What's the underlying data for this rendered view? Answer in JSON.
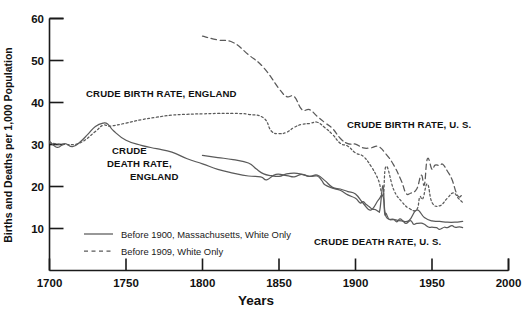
{
  "chart_data": {
    "type": "line",
    "title": "",
    "xlabel": "Years",
    "ylabel": "Births and Deaths per 1,000 Population",
    "xlim": [
      1700,
      2000
    ],
    "ylim": [
      0,
      60
    ],
    "xticks": [
      1700,
      1750,
      1800,
      1850,
      1900,
      1950,
      2000
    ],
    "yticks": [
      10,
      20,
      30,
      40,
      50,
      60
    ],
    "grid": false,
    "legend_position": "lower-left-inside",
    "legend": [
      {
        "label": "Before 1900, Massachusetts, White Only",
        "style": "solid"
      },
      {
        "label": "Before 1909, White Only",
        "style": "dotted"
      }
    ],
    "annotations": [
      {
        "text": "CRUDE BIRTH  RATE, ENGLAND",
        "x": 1756,
        "y": 40.3
      },
      {
        "text": "CRUDE",
        "x": 1747,
        "y": 26.6
      },
      {
        "text": "DEATH RATE,",
        "x": 1744,
        "y": 24.3
      },
      {
        "text": "ENGLAND",
        "x": 1760,
        "y": 22.2
      },
      {
        "text": "CRUDE BIRTH RATE, U. S.",
        "x": 1905,
        "y": 36.7
      },
      {
        "text": "CRUDE DEATH RATE, U. S.",
        "x": 1900,
        "y": 9.4
      }
    ],
    "series": [
      {
        "name": "Crude Birth Rate, England",
        "style": "dotted",
        "points": [
          [
            1700,
            30.4
          ],
          [
            1710,
            30.0
          ],
          [
            1720,
            30.4
          ],
          [
            1730,
            33.1
          ],
          [
            1735,
            34.6
          ],
          [
            1740,
            34.4
          ],
          [
            1750,
            35.1
          ],
          [
            1760,
            35.9
          ],
          [
            1770,
            36.5
          ],
          [
            1780,
            37.0
          ],
          [
            1790,
            37.2
          ],
          [
            1800,
            37.3
          ],
          [
            1810,
            37.4
          ],
          [
            1820,
            37.4
          ],
          [
            1830,
            37.2
          ],
          [
            1840,
            36.3
          ],
          [
            1845,
            33.2
          ],
          [
            1850,
            32.6
          ],
          [
            1855,
            32.9
          ],
          [
            1860,
            34.1
          ],
          [
            1865,
            34.8
          ],
          [
            1870,
            35.0
          ],
          [
            1875,
            35.3
          ],
          [
            1880,
            34.0
          ],
          [
            1885,
            32.4
          ],
          [
            1890,
            30.3
          ],
          [
            1895,
            29.6
          ],
          [
            1900,
            28.0
          ],
          [
            1905,
            27.2
          ],
          [
            1910,
            24.9
          ],
          [
            1915,
            21.5
          ],
          [
            1918,
            17.8
          ],
          [
            1920,
            24.8
          ],
          [
            1925,
            19.2
          ],
          [
            1930,
            16.5
          ],
          [
            1935,
            14.8
          ],
          [
            1940,
            14.5
          ],
          [
            1942,
            17.5
          ],
          [
            1944,
            17.1
          ],
          [
            1947,
            20.6
          ],
          [
            1950,
            16.2
          ],
          [
            1955,
            15.4
          ],
          [
            1960,
            17.2
          ],
          [
            1964,
            18.5
          ],
          [
            1967,
            17.3
          ],
          [
            1970,
            16.2
          ]
        ]
      },
      {
        "name": "Crude Death Rate, England",
        "style": "solid",
        "points": [
          [
            1700,
            30.8
          ],
          [
            1705,
            29.3
          ],
          [
            1710,
            30.2
          ],
          [
            1715,
            29.5
          ],
          [
            1720,
            30.6
          ],
          [
            1725,
            32.4
          ],
          [
            1730,
            34.3
          ],
          [
            1735,
            35.1
          ],
          [
            1738,
            34.9
          ],
          [
            1742,
            33.2
          ],
          [
            1750,
            31.0
          ],
          [
            1760,
            29.8
          ],
          [
            1770,
            29.0
          ],
          [
            1780,
            28.2
          ],
          [
            1790,
            26.6
          ],
          [
            1800,
            25.4
          ],
          [
            1810,
            24.1
          ],
          [
            1820,
            23.2
          ],
          [
            1830,
            22.5
          ],
          [
            1838,
            22.3
          ],
          [
            1842,
            21.6
          ],
          [
            1848,
            22.9
          ],
          [
            1855,
            22.6
          ],
          [
            1860,
            22.3
          ],
          [
            1865,
            22.9
          ],
          [
            1870,
            22.4
          ],
          [
            1875,
            22.7
          ],
          [
            1880,
            21.4
          ],
          [
            1885,
            19.8
          ],
          [
            1890,
            19.4
          ],
          [
            1895,
            18.8
          ],
          [
            1900,
            18.2
          ],
          [
            1905,
            16.0
          ],
          [
            1910,
            14.4
          ],
          [
            1915,
            16.8
          ],
          [
            1918,
            17.6
          ],
          [
            1920,
            12.8
          ],
          [
            1925,
            12.2
          ],
          [
            1930,
            11.8
          ],
          [
            1935,
            11.9
          ],
          [
            1940,
            14.4
          ],
          [
            1945,
            12.6
          ],
          [
            1950,
            11.8
          ],
          [
            1955,
            11.7
          ],
          [
            1960,
            11.5
          ],
          [
            1965,
            11.5
          ],
          [
            1970,
            11.7
          ]
        ]
      },
      {
        "name": "Crude Birth Rate, U. S.",
        "style": "dashed",
        "points": [
          [
            1800,
            55.8
          ],
          [
            1810,
            54.9
          ],
          [
            1820,
            54.3
          ],
          [
            1830,
            51.4
          ],
          [
            1840,
            48.3
          ],
          [
            1850,
            43.3
          ],
          [
            1855,
            41.4
          ],
          [
            1860,
            41.4
          ],
          [
            1865,
            38.3
          ],
          [
            1870,
            38.3
          ],
          [
            1875,
            36.7
          ],
          [
            1880,
            35.2
          ],
          [
            1885,
            33.8
          ],
          [
            1890,
            31.5
          ],
          [
            1895,
            30.2
          ],
          [
            1900,
            30.1
          ],
          [
            1905,
            29.2
          ],
          [
            1910,
            29.2
          ],
          [
            1915,
            29.5
          ],
          [
            1920,
            27.7
          ],
          [
            1925,
            25.1
          ],
          [
            1930,
            21.3
          ],
          [
            1933,
            18.4
          ],
          [
            1936,
            18.4
          ],
          [
            1940,
            19.4
          ],
          [
            1943,
            22.7
          ],
          [
            1945,
            20.4
          ],
          [
            1947,
            26.6
          ],
          [
            1950,
            24.1
          ],
          [
            1952,
            25.1
          ],
          [
            1955,
            25.0
          ],
          [
            1957,
            25.3
          ],
          [
            1960,
            23.7
          ],
          [
            1963,
            21.7
          ],
          [
            1966,
            18.4
          ],
          [
            1968,
            17.5
          ],
          [
            1970,
            18.4
          ]
        ]
      },
      {
        "name": "Crude Death Rate, U. S.",
        "style": "solid",
        "points": [
          [
            1800,
            27.4
          ],
          [
            1810,
            26.9
          ],
          [
            1820,
            26.4
          ],
          [
            1830,
            25.6
          ],
          [
            1835,
            24.2
          ],
          [
            1840,
            23.0
          ],
          [
            1845,
            22.6
          ],
          [
            1850,
            22.4
          ],
          [
            1855,
            23.0
          ],
          [
            1860,
            23.2
          ],
          [
            1865,
            22.9
          ],
          [
            1870,
            22.4
          ],
          [
            1875,
            22.5
          ],
          [
            1878,
            21.4
          ],
          [
            1880,
            20.4
          ],
          [
            1885,
            19.6
          ],
          [
            1890,
            19.1
          ],
          [
            1895,
            18.0
          ],
          [
            1900,
            17.2
          ],
          [
            1903,
            16.1
          ],
          [
            1905,
            16.4
          ],
          [
            1907,
            15.7
          ],
          [
            1909,
            15.2
          ],
          [
            1911,
            14.6
          ],
          [
            1913,
            14.5
          ],
          [
            1915,
            14.1
          ],
          [
            1916,
            14.6
          ],
          [
            1918,
            20.2
          ],
          [
            1919,
            13.8
          ],
          [
            1920,
            13.6
          ],
          [
            1922,
            12.2
          ],
          [
            1925,
            12.1
          ],
          [
            1927,
            11.6
          ],
          [
            1929,
            12.3
          ],
          [
            1931,
            11.8
          ],
          [
            1933,
            11.2
          ],
          [
            1936,
            11.9
          ],
          [
            1938,
            11.0
          ],
          [
            1940,
            11.2
          ],
          [
            1943,
            11.3
          ],
          [
            1945,
            11.0
          ],
          [
            1948,
            10.3
          ],
          [
            1950,
            10.3
          ],
          [
            1953,
            10.2
          ],
          [
            1955,
            9.8
          ],
          [
            1958,
            10.3
          ],
          [
            1960,
            10.2
          ],
          [
            1963,
            10.7
          ],
          [
            1965,
            10.3
          ],
          [
            1968,
            10.4
          ],
          [
            1970,
            10.2
          ]
        ]
      }
    ]
  },
  "axis": {
    "x_tick_labels": [
      "1700",
      "1750",
      "1800",
      "1850",
      "1900",
      "1950",
      "2000"
    ],
    "y_tick_labels": [
      "10",
      "20",
      "30",
      "40",
      "50",
      "60"
    ],
    "x_title": "Years",
    "y_title": "Births and Deaths per 1,000 Population"
  },
  "legend": {
    "item1": "Before 1900, Massachusetts, White Only",
    "item2": "Before 1909, White Only"
  },
  "annotations": {
    "birth_england": "CRUDE BIRTH  RATE, ENGLAND",
    "death_england_l1": "CRUDE",
    "death_england_l2": "DEATH RATE,",
    "death_england_l3": "ENGLAND",
    "birth_us": "CRUDE BIRTH RATE, U. S.",
    "death_us": "CRUDE DEATH RATE, U. S."
  },
  "colors": {
    "axis": "#1a1a1a",
    "series": "#5a5a5a",
    "text": "#111111",
    "background": "#ffffff"
  }
}
